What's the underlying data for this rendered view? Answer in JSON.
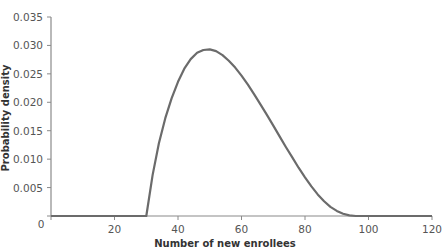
{
  "chart_data": {
    "type": "line",
    "title": "",
    "xlabel": "Number of new enrollees",
    "ylabel": "Probability density",
    "xlim": [
      0,
      120
    ],
    "ylim": [
      0,
      0.035
    ],
    "grid": false,
    "legend": null,
    "x_ticks": [
      0,
      20,
      40,
      60,
      80,
      100,
      120
    ],
    "x_tick_labels": [
      "0",
      "20",
      "40",
      "60",
      "80",
      "100",
      "120"
    ],
    "y_ticks": [
      0.005,
      0.01,
      0.015,
      0.02,
      0.025,
      0.03,
      0.035
    ],
    "y_tick_labels": [
      "0.005",
      "0.010",
      "0.015",
      "0.020",
      "0.025",
      "0.030",
      "0.035"
    ],
    "series": [
      {
        "name": "density",
        "color": "#6b6b6b",
        "x": [
          0,
          10,
          20,
          30,
          32,
          34,
          36,
          38,
          40,
          42,
          44,
          46,
          48,
          50,
          52,
          54,
          56,
          58,
          60,
          62,
          64,
          66,
          68,
          70,
          72,
          74,
          76,
          78,
          80,
          82,
          84,
          86,
          88,
          90,
          92,
          94,
          96,
          98,
          100,
          110,
          120
        ],
        "values": [
          0,
          0,
          0,
          0,
          0.0072,
          0.0128,
          0.0172,
          0.0207,
          0.0236,
          0.0259,
          0.0276,
          0.0287,
          0.0292,
          0.0293,
          0.029,
          0.0283,
          0.0273,
          0.0261,
          0.0247,
          0.0231,
          0.0214,
          0.0196,
          0.0178,
          0.0159,
          0.014,
          0.0121,
          0.0103,
          0.0085,
          0.0068,
          0.0052,
          0.0038,
          0.0026,
          0.0016,
          0.0009,
          0.0004,
          0.0001,
          0.0,
          0.0,
          0,
          0,
          0
        ]
      }
    ]
  }
}
